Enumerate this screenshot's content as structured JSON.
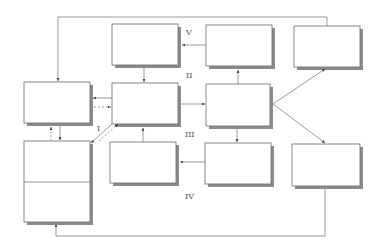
{
  "diagram": {
    "title": "",
    "stage_labels": {
      "I": "I",
      "II": "II",
      "III": "III",
      "IV": "IV",
      "V": "V"
    },
    "boxes": [
      {
        "id": "top-center",
        "text": ""
      },
      {
        "id": "top-middle-right",
        "text": ""
      },
      {
        "id": "top-right",
        "text": ""
      },
      {
        "id": "left-middle",
        "text": ""
      },
      {
        "id": "center",
        "text": ""
      },
      {
        "id": "middle-right",
        "text": ""
      },
      {
        "id": "left-bottom-upper",
        "text": ""
      },
      {
        "id": "left-bottom-lower",
        "text": ""
      },
      {
        "id": "bottom-center",
        "text": ""
      },
      {
        "id": "bottom-middle-right",
        "text": ""
      },
      {
        "id": "bottom-right",
        "text": ""
      }
    ],
    "connections": [
      {
        "from": "top-right",
        "to": "left-middle",
        "style": "solid",
        "route": "top feedback loop"
      },
      {
        "from": "top-center",
        "to": "center",
        "style": "solid"
      },
      {
        "from": "middle-right",
        "to": "top-middle-right",
        "style": "solid"
      },
      {
        "from": "top-middle-right",
        "to": "top-center",
        "style": "solid"
      },
      {
        "from": "center",
        "to": "left-middle",
        "style": "solid"
      },
      {
        "from": "left-middle",
        "to": "center",
        "style": "dashed"
      },
      {
        "from": "center",
        "to": "middle-right",
        "style": "solid"
      },
      {
        "from": "middle-right",
        "to": "top-right",
        "style": "solid"
      },
      {
        "from": "middle-right",
        "to": "bottom-right",
        "style": "solid"
      },
      {
        "from": "middle-right",
        "to": "bottom-middle-right",
        "style": "solid"
      },
      {
        "from": "bottom-middle-right",
        "to": "bottom-center",
        "style": "solid"
      },
      {
        "from": "bottom-center",
        "to": "center",
        "style": "solid"
      },
      {
        "from": "left-bottom-upper",
        "to": "left-middle",
        "style": "dashed"
      },
      {
        "from": "left-middle",
        "to": "left-bottom-upper",
        "style": "solid"
      },
      {
        "from": "center",
        "to": "left-bottom-upper",
        "style": "solid"
      },
      {
        "from": "left-bottom-upper",
        "to": "center",
        "style": "dashed"
      },
      {
        "from": "bottom-right",
        "to": "left-bottom-lower",
        "style": "solid",
        "route": "bottom feedback loop"
      }
    ]
  }
}
